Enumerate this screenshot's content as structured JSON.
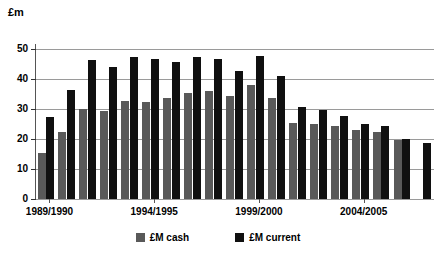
{
  "chart_data": {
    "type": "bar",
    "title": "",
    "ylabel": "£m",
    "xlabel": "",
    "ylim": [
      0,
      50
    ],
    "yticks": [
      0,
      10,
      20,
      30,
      40,
      50
    ],
    "grid": true,
    "legend_position": "bottom",
    "categories": [
      "1989/1990",
      "1990/1991",
      "1991/1992",
      "1992/1993",
      "1993/1994",
      "1994/1995",
      "1995/1996",
      "1996/1997",
      "1997/1998",
      "1998/1999",
      "1999/2000",
      "2000/2001",
      "2001/2002",
      "2002/2003",
      "2003/2004",
      "2004/2005",
      "2005/2006",
      "2006/2007",
      "2007/2008"
    ],
    "tick_labels": [
      "1989/1990",
      "1994/1995",
      "1999/2000",
      "2004/2005"
    ],
    "tick_label_indices": [
      0,
      5,
      10,
      15
    ],
    "series": [
      {
        "name": "£M cash",
        "color": "#595959",
        "values": [
          15.2,
          22.2,
          29.9,
          29.3,
          32.8,
          32.3,
          33.7,
          35.3,
          36.0,
          34.2,
          38.0,
          33.8,
          25.5,
          25.1,
          24.3,
          22.9,
          22.4,
          19.8,
          null
        ]
      },
      {
        "name": "£M current",
        "color": "#101010",
        "values": [
          27.5,
          36.5,
          46.2,
          44.0,
          47.3,
          46.6,
          45.8,
          47.5,
          46.6,
          42.7,
          47.8,
          41.1,
          30.6,
          29.6,
          27.8,
          24.9,
          24.3,
          20.1,
          18.6
        ]
      }
    ]
  },
  "axis": {
    "y_title": "£m",
    "y_tick_labels": [
      "50",
      "40",
      "30",
      "20",
      "10",
      "0"
    ]
  },
  "legend": {
    "items": [
      {
        "label": "£M cash",
        "color": "#595959"
      },
      {
        "label": "£M current",
        "color": "#101010"
      }
    ]
  }
}
